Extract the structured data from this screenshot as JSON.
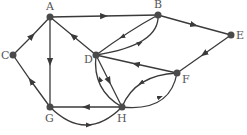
{
  "diagram": {
    "type": "directed-graph",
    "nodes": [
      {
        "id": "A",
        "label": "A",
        "x": 50,
        "y": 17
      },
      {
        "id": "B",
        "label": "B",
        "x": 158,
        "y": 15
      },
      {
        "id": "C",
        "label": "C",
        "x": 13,
        "y": 55
      },
      {
        "id": "D",
        "label": "D",
        "x": 96,
        "y": 55
      },
      {
        "id": "E",
        "label": "E",
        "x": 231,
        "y": 35
      },
      {
        "id": "F",
        "label": "F",
        "x": 177,
        "y": 73
      },
      {
        "id": "G",
        "label": "G",
        "x": 50,
        "y": 107
      },
      {
        "id": "H",
        "label": "H",
        "x": 122,
        "y": 107
      }
    ],
    "edges": [
      {
        "from": "A",
        "to": "B"
      },
      {
        "from": "B",
        "to": "E"
      },
      {
        "from": "E",
        "to": "F"
      },
      {
        "from": "F",
        "to": "D"
      },
      {
        "from": "C",
        "to": "A"
      },
      {
        "from": "G",
        "to": "C"
      },
      {
        "from": "A",
        "to": "G"
      },
      {
        "from": "D",
        "to": "A"
      },
      {
        "from": "B",
        "to": "D"
      },
      {
        "from": "D",
        "to": "B"
      },
      {
        "from": "D",
        "to": "H"
      },
      {
        "from": "H",
        "to": "D"
      },
      {
        "from": "H",
        "to": "G"
      },
      {
        "from": "G",
        "to": "H"
      },
      {
        "from": "F",
        "to": "H"
      },
      {
        "from": "H",
        "to": "F"
      }
    ]
  }
}
